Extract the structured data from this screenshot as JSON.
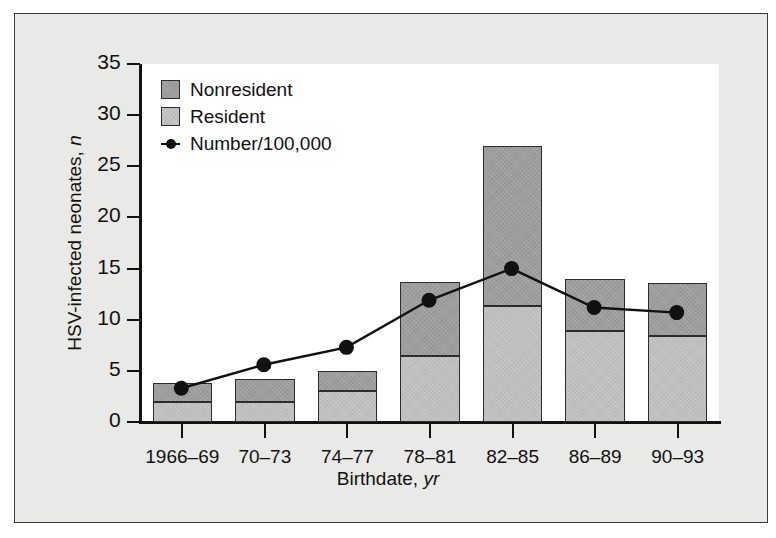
{
  "chart_data": {
    "type": "bar",
    "title": "",
    "xlabel": "Birthdate, yr",
    "xlabel_main": "Birthdate,",
    "xlabel_unit": "yr",
    "ylabel": "HSV-infected neonates, n",
    "ylabel_main": "HSV-infected neonates,",
    "ylabel_unit": "n",
    "ylim": [
      0,
      35
    ],
    "yticks": [
      0,
      5,
      10,
      15,
      20,
      25,
      30,
      35
    ],
    "ytick_labels": [
      "0",
      "5",
      "10",
      "15",
      "20",
      "25",
      "30",
      "35"
    ],
    "grid": false,
    "legend_position": "top-left",
    "categories": [
      "1966–69",
      "70–73",
      "74–77",
      "78–81",
      "82–85",
      "86–89",
      "90–93"
    ],
    "stacked": true,
    "series": [
      {
        "name": "Resident",
        "type": "bar",
        "color": "#bfbfbf",
        "values": [
          2.0,
          2.0,
          3.0,
          6.5,
          11.3,
          8.9,
          8.4
        ]
      },
      {
        "name": "Nonresident",
        "type": "bar",
        "color": "#9d9d9d",
        "values": [
          1.8,
          2.2,
          2.0,
          7.2,
          15.7,
          5.1,
          5.2
        ]
      },
      {
        "name": "Number/100,000",
        "type": "line",
        "color": "#111111",
        "values": [
          3.2,
          5.5,
          7.2,
          11.8,
          14.9,
          11.1,
          10.6
        ]
      }
    ],
    "totals": [
      3.8,
      4.2,
      5.0,
      13.7,
      27.0,
      14.0,
      13.6
    ],
    "legend": [
      "Nonresident",
      "Resident",
      "Number/100,000"
    ]
  },
  "figure": {
    "panel_background": "#e9e9e7",
    "plot_background": "#ffffff",
    "axis_color": "#111111",
    "border_color": "#3a3a3a"
  }
}
